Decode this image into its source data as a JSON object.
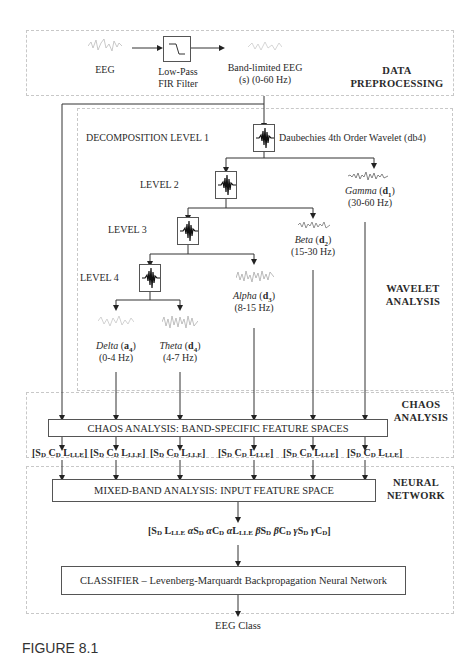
{
  "sections": {
    "preprocessing": "DATA PREPROCESSING",
    "wavelet": "WAVELET ANALYSIS",
    "chaos": "CHAOS ANALYSIS",
    "neural": "NEURAL NETWORK"
  },
  "preprocessing": {
    "input_label": "EEG",
    "filter_label_1": "Low-Pass",
    "filter_label_2": "FIR Filter",
    "output_label_1": "Band-limited EEG",
    "output_label_2": "(s) (0-60 Hz)"
  },
  "wavelet": {
    "level1": "DECOMPOSITION LEVEL 1",
    "level2": "LEVEL 2",
    "level3": "LEVEL 3",
    "level4": "LEVEL 4",
    "wavelet_name": "Daubechies 4th Order Wavelet (db4)",
    "bands": [
      {
        "name": "Gamma",
        "coef": "d",
        "sub": "1",
        "range": "(30-60 Hz)"
      },
      {
        "name": "Beta",
        "coef": "d",
        "sub": "2",
        "range": "(15-30 Hz)"
      },
      {
        "name": "Alpha",
        "coef": "d",
        "sub": "3",
        "range": "(8-15 Hz)"
      },
      {
        "name": "Delta",
        "coef": "a",
        "sub": "4",
        "range": "(0-4 Hz)"
      },
      {
        "name": "Theta",
        "coef": "d",
        "sub": "4",
        "range": "(4-7 Hz)"
      }
    ]
  },
  "chaos": {
    "box_label": "CHAOS ANALYSIS: BAND-SPECIFIC FEATURE SPACES",
    "feature_vector": {
      "s": "S",
      "s_sub": "D",
      "c": "C",
      "c_sub": "D",
      "l": "L",
      "l_sub": "LLE"
    }
  },
  "neural": {
    "mixed_label": "MIXED-BAND ANALYSIS: INPUT FEATURE SPACE",
    "input_vector": "[SD LLLE αSD αCD αLLLE βSD βCD γSD γCD]",
    "classifier_label": "CLASSIFIER – Levenberg-Marquardt Backpropagation Neural Network",
    "output_label": "EEG Class"
  },
  "caption": "FIGURE 8.1"
}
